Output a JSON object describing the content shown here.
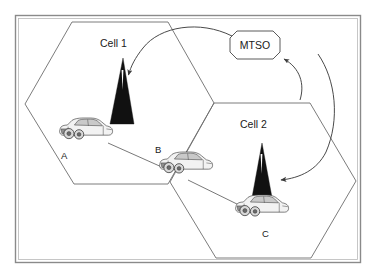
{
  "figure": {
    "type": "cellular-handoff-diagram"
  },
  "cells": [
    {
      "id": "cell1",
      "label": "Cell 1"
    },
    {
      "id": "cell2",
      "label": "Cell 2"
    }
  ],
  "switch": {
    "label": "MTSO"
  },
  "vehicles": [
    {
      "id": "a",
      "label": "A"
    },
    {
      "id": "b",
      "label": "B"
    },
    {
      "id": "c",
      "label": "C"
    }
  ],
  "towers": [
    {
      "id": "tower1",
      "name": "cell-1-base-station"
    },
    {
      "id": "tower2",
      "name": "cell-2-base-station"
    }
  ],
  "colors": {
    "tower_fill": "#111111",
    "hex_stroke": "#6d6d6d",
    "frame_stroke": "#8a8a8a",
    "curve_stroke": "#4a4a4a",
    "link_stroke": "#555555",
    "background": "#ffffff"
  }
}
